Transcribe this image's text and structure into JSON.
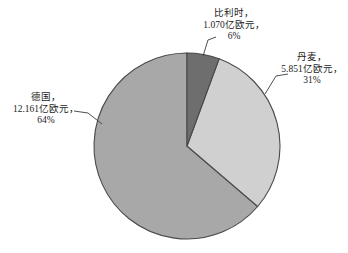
{
  "chart_data": {
    "type": "pie",
    "title": "",
    "subtitle": "",
    "xlabel": "",
    "ylabel": "",
    "legend_position": "none",
    "label_format": "name, value, percent",
    "unit": "亿欧元",
    "categories": [
      "比利时",
      "丹麦",
      "德国"
    ],
    "values": [
      1.07,
      5.851,
      12.161
    ],
    "percents": [
      6,
      31,
      64
    ],
    "colors": [
      "#6e6e6e",
      "#d0d0d0",
      "#a8a8a8"
    ],
    "slices": [
      {
        "name": "比利时",
        "value": 1.07,
        "value_text": "1.070亿欧元",
        "percent": 6,
        "percent_text": "6%",
        "color": "#6e6e6e",
        "start_angle_deg": 0,
        "end_angle_deg": 21.6
      },
      {
        "name": "丹麦",
        "value": 5.851,
        "value_text": "5.851亿欧元",
        "percent": 31,
        "percent_text": "31%",
        "color": "#d0d0d0",
        "start_angle_deg": 21.6,
        "end_angle_deg": 133.2
      },
      {
        "name": "德国",
        "value": 12.161,
        "value_text": "12.161亿欧元",
        "percent": 64,
        "percent_text": "64%",
        "color": "#a8a8a8",
        "start_angle_deg": 133.2,
        "end_angle_deg": 360
      }
    ]
  },
  "callouts": {
    "belgium": {
      "line1": "比利时，",
      "line2": "1.070亿欧元，",
      "line3": "6%"
    },
    "denmark": {
      "line1": "丹麦，",
      "line2": "5.851亿欧元，",
      "line3": "31%"
    },
    "germany": {
      "line1": "德国，",
      "line2": "12.161亿欧元，",
      "line3": "64%"
    }
  },
  "style": {
    "background": "#ffffff",
    "outline": "#4a4a4a",
    "leader_line": "#3c3c3c",
    "text_color": "#1b1b1b"
  }
}
